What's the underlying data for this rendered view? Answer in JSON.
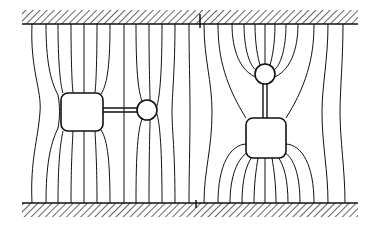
{
  "figure": {
    "description": "Field lines in a channel between two hatched walls, distorted by two dumbbell-shaped obstacles (square body with rod and sphere)",
    "left_object": {
      "orientation": "horizontal",
      "body": "rounded-square",
      "end": "circle"
    },
    "right_object": {
      "orientation": "vertical",
      "body": "rounded-square",
      "end": "circle"
    },
    "walls": {
      "top": "hatched",
      "bottom": "hatched"
    }
  },
  "colors": {
    "ink": "#111111",
    "background": "#ffffff"
  }
}
